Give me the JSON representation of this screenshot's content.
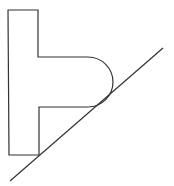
{
  "diagram": {
    "stroke_color": "#333333",
    "background": "#ffffff",
    "shape": {
      "name": "t-shaped-body",
      "path": "M 8 10 L 38 10 L 38 57 L 88 57 A 25 25 0 0 1 88 107 L 39 107 L 39 155 L 9 155 Z"
    },
    "incline": {
      "name": "inclined-line",
      "x1": 10,
      "y1": 181,
      "x2": 163,
      "y2": 48
    }
  }
}
